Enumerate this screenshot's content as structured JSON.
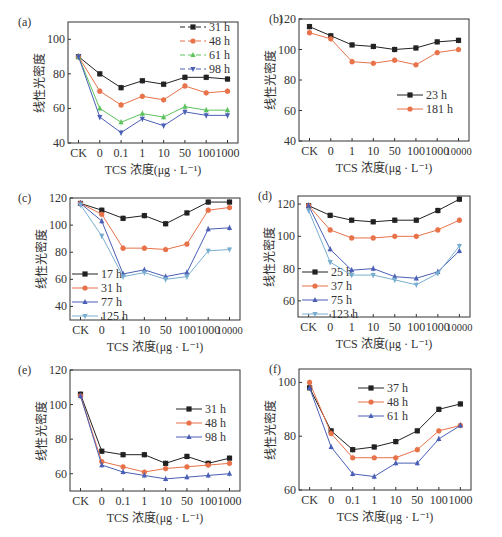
{
  "colors": {
    "black": "#222222",
    "orange": "#e8734a",
    "green": "#5cc35c",
    "blue": "#4a5fb5",
    "lightblue": "#7aaed0"
  },
  "chart_data": [
    {
      "id": "a",
      "label": "(a)",
      "type": "line",
      "xlabel": "TCS 浓度(μg · L⁻¹)",
      "ylabel": "线性光密度",
      "categories": [
        "CK",
        "0",
        "0.1",
        "1",
        "10",
        "50",
        "100",
        "1000"
      ],
      "ylim": [
        40,
        110
      ],
      "yticks": [
        40,
        60,
        80,
        100
      ],
      "legend_position": "top-right",
      "series": [
        {
          "name": "31 h",
          "color": "#222222",
          "marker": "square",
          "dashed": true,
          "values": [
            90,
            80,
            72,
            76,
            74,
            78,
            78,
            77
          ]
        },
        {
          "name": "48 h",
          "color": "#e8734a",
          "marker": "circle",
          "dashed": true,
          "values": [
            90,
            70,
            62,
            67,
            65,
            73,
            69,
            70
          ]
        },
        {
          "name": "61 h",
          "color": "#5cc35c",
          "marker": "triangle-up",
          "dashed": true,
          "values": [
            90,
            60,
            52,
            57,
            55,
            61,
            59,
            59
          ]
        },
        {
          "name": "98 h",
          "color": "#4a5fb5",
          "marker": "triangle-down",
          "dashed": true,
          "values": [
            90,
            55,
            46,
            54,
            50,
            58,
            56,
            56
          ]
        }
      ]
    },
    {
      "id": "b",
      "label": "(b)",
      "type": "line",
      "xlabel": "TCS 浓度(μg · L⁻¹)",
      "ylabel": "线性光密度",
      "categories": [
        "CK",
        "0",
        "1",
        "10",
        "50",
        "100",
        "1000",
        "10000"
      ],
      "ylim": [
        40,
        120
      ],
      "yticks": [
        40,
        60,
        80,
        100,
        120
      ],
      "legend_position": "center-right",
      "series": [
        {
          "name": "23 h",
          "color": "#222222",
          "marker": "square",
          "values": [
            115,
            109,
            103,
            102,
            100,
            101,
            105,
            106
          ]
        },
        {
          "name": "181 h",
          "color": "#e8734a",
          "marker": "circle",
          "values": [
            111,
            107,
            92,
            91,
            93,
            90,
            98,
            100
          ]
        }
      ]
    },
    {
      "id": "c",
      "label": "(c)",
      "type": "line",
      "xlabel": "TCS 浓度(μg · L⁻¹)",
      "ylabel": "线性光密度",
      "categories": [
        "CK",
        "0",
        "1",
        "10",
        "50",
        "100",
        "1000",
        "10000"
      ],
      "ylim": [
        30,
        120
      ],
      "yticks": [
        40,
        60,
        80,
        100,
        120
      ],
      "legend_position": "bottom-left",
      "series": [
        {
          "name": "17 h",
          "color": "#222222",
          "marker": "square",
          "values": [
            116,
            111,
            105,
            107,
            101,
            109,
            117,
            117
          ]
        },
        {
          "name": "31 h",
          "color": "#e8734a",
          "marker": "circle",
          "values": [
            116,
            108,
            83,
            83,
            82,
            86,
            111,
            113
          ]
        },
        {
          "name": "77 h",
          "color": "#4a5fb5",
          "marker": "triangle-up",
          "values": [
            116,
            103,
            64,
            67,
            62,
            65,
            97,
            98
          ]
        },
        {
          "name": "125 h",
          "color": "#7aaed0",
          "marker": "triangle-down",
          "values": [
            115,
            92,
            62,
            65,
            60,
            62,
            81,
            82
          ]
        }
      ]
    },
    {
      "id": "d",
      "label": "(d)",
      "type": "line",
      "xlabel": "TCS 浓度(μg · L⁻¹)",
      "ylabel": "线性光密度",
      "categories": [
        "CK",
        "0",
        "1",
        "10",
        "50",
        "100",
        "1000",
        "10000"
      ],
      "ylim": [
        50,
        125
      ],
      "yticks": [
        60,
        80,
        100,
        120
      ],
      "legend_position": "bottom-left",
      "series": [
        {
          "name": "25 h",
          "color": "#222222",
          "marker": "square",
          "values": [
            119,
            113,
            110,
            109,
            110,
            110,
            116,
            123
          ]
        },
        {
          "name": "37 h",
          "color": "#e8734a",
          "marker": "circle",
          "values": [
            119,
            104,
            99,
            99,
            100,
            100,
            104,
            110
          ]
        },
        {
          "name": "75 h",
          "color": "#4a5fb5",
          "marker": "triangle-up",
          "values": [
            119,
            92,
            79,
            80,
            75,
            74,
            78,
            91
          ]
        },
        {
          "name": "123 h",
          "color": "#7aaed0",
          "marker": "triangle-down",
          "values": [
            116,
            84,
            76,
            76,
            73,
            70,
            77,
            94
          ]
        }
      ]
    },
    {
      "id": "e",
      "label": "(e)",
      "type": "line",
      "xlabel": "TCS 浓度(μg · L⁻¹)",
      "ylabel": "线性光密度",
      "categories": [
        "CK",
        "0",
        "0.1",
        "1",
        "10",
        "50",
        "100",
        "1000"
      ],
      "ylim": [
        50,
        120
      ],
      "yticks": [
        60,
        80,
        100,
        120
      ],
      "legend_position": "top-right",
      "series": [
        {
          "name": "31 h",
          "color": "#222222",
          "marker": "square",
          "values": [
            106,
            73,
            71,
            71,
            66,
            70,
            66,
            69
          ]
        },
        {
          "name": "48 h",
          "color": "#e8734a",
          "marker": "circle",
          "values": [
            105,
            67,
            64,
            61,
            63,
            64,
            65,
            66
          ]
        },
        {
          "name": "98 h",
          "color": "#4a5fb5",
          "marker": "triangle-up",
          "values": [
            105,
            65,
            61,
            59,
            57,
            58,
            59,
            60
          ]
        }
      ]
    },
    {
      "id": "f",
      "label": "(f)",
      "type": "line",
      "xlabel": "TCS 浓度(μg · L⁻¹)",
      "ylabel": "线性光密度",
      "categories": [
        "CK",
        "0",
        "0.1",
        "1",
        "10",
        "50",
        "100",
        "1000"
      ],
      "ylim": [
        60,
        105
      ],
      "yticks": [
        60,
        80,
        100
      ],
      "legend_position": "top-center",
      "series": [
        {
          "name": "37 h",
          "color": "#222222",
          "marker": "square",
          "values": [
            98,
            82,
            75,
            76,
            78,
            82,
            90,
            92
          ]
        },
        {
          "name": "48 h",
          "color": "#e8734a",
          "marker": "circle",
          "values": [
            100,
            81,
            72,
            72,
            72,
            75,
            82,
            84
          ]
        },
        {
          "name": "61 h",
          "color": "#4a5fb5",
          "marker": "triangle-up",
          "values": [
            98,
            76,
            66,
            65,
            70,
            70,
            79,
            84
          ]
        }
      ]
    }
  ],
  "layout": [
    {
      "x": 0,
      "y": 0,
      "w": 251,
      "h": 180,
      "plot": {
        "l": 68,
        "t": 22,
        "r": 238,
        "b": 143
      },
      "legend": {
        "x": 180,
        "y": 27,
        "dy": 14
      }
    },
    {
      "x": 251,
      "y": 0,
      "w": 251,
      "h": 180,
      "plot": {
        "l": 48,
        "t": 19,
        "r": 218,
        "b": 141
      },
      "legend": {
        "x": 146,
        "y": 95,
        "dy": 14
      }
    },
    {
      "x": 0,
      "y": 180,
      "w": 251,
      "h": 180,
      "plot": {
        "l": 70,
        "t": 18,
        "r": 240,
        "b": 140
      },
      "legend": {
        "x": 72,
        "y": 94,
        "dy": 14
      }
    },
    {
      "x": 240,
      "y": 180,
      "w": 262,
      "h": 180,
      "plot": {
        "l": 58,
        "t": 16,
        "r": 230,
        "b": 137
      },
      "legend": {
        "x": 62,
        "y": 92,
        "dy": 14
      }
    },
    {
      "x": 0,
      "y": 355,
      "w": 251,
      "h": 182,
      "plot": {
        "l": 70,
        "t": 15,
        "r": 240,
        "b": 136
      },
      "legend": {
        "x": 176,
        "y": 54,
        "dy": 14
      }
    },
    {
      "x": 251,
      "y": 355,
      "w": 251,
      "h": 182,
      "plot": {
        "l": 48,
        "t": 14,
        "r": 220,
        "b": 135
      },
      "legend": {
        "x": 107,
        "y": 33,
        "dy": 14
      }
    }
  ]
}
